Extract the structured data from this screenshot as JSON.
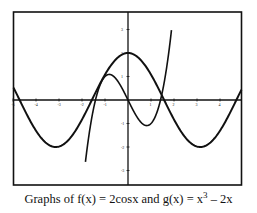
{
  "chart_data": {
    "type": "line",
    "caption": {
      "prefix": "Graphs of f(x) = 2cosx and g(x) = x",
      "exponent": "3",
      "suffix": " – 2x"
    },
    "xlabel": "",
    "ylabel": "",
    "xlim": [
      -5.0,
      4.9
    ],
    "ylim": [
      -3.6,
      3.75
    ],
    "grid": false,
    "legend": "none",
    "x_ticks": [
      -5,
      -4,
      -3,
      -2,
      -1,
      1,
      2,
      3,
      4
    ],
    "x_tick_labels": [
      "-5",
      "-4",
      "-3",
      "-2",
      "-1",
      "1",
      "2",
      "3",
      "4"
    ],
    "y_ticks": [
      -3,
      -2,
      -1,
      1,
      2,
      3
    ],
    "y_tick_labels": [
      "-3",
      "-2",
      "-1",
      "1",
      "2",
      "3"
    ],
    "series": [
      {
        "name": "f(x) = 2cosx",
        "x": [
          -5,
          -4,
          -3,
          -2,
          -1,
          0,
          1,
          2,
          3,
          4,
          4.9
        ],
        "values": [
          0.567,
          -1.307,
          -1.98,
          -0.832,
          1.081,
          2.0,
          1.081,
          -0.832,
          -1.98,
          -1.307,
          0.375
        ]
      },
      {
        "name": "g(x) = x^3 - 2x",
        "x": [
          -1.8,
          -1.5,
          -1,
          -0.5,
          0,
          0.5,
          0.816,
          1,
          1.5,
          1.87
        ],
        "values": [
          -2.232,
          -0.375,
          1.0,
          0.875,
          0.0,
          -0.875,
          -1.089,
          -1.0,
          0.375,
          2.799
        ]
      }
    ],
    "intersections_approx": [
      [
        -1.26,
        0.61
      ],
      [
        1.39,
        0.36
      ]
    ]
  }
}
